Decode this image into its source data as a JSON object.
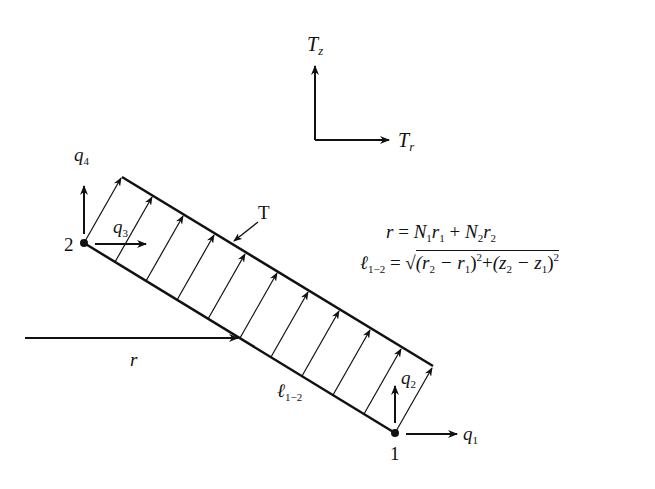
{
  "figure": {
    "type": "axisymmetric element surface traction diagram",
    "colors": {
      "ink": "#111111",
      "background": "#ffffff"
    }
  },
  "axes": {
    "vertical_label": {
      "main": "T",
      "sub": "z"
    },
    "horizontal_label": {
      "main": "T",
      "sub": "r"
    }
  },
  "nodes": {
    "node_1": {
      "label": "1",
      "dof_horizontal": {
        "main": "q",
        "sub": "1"
      },
      "dof_vertical": {
        "main": "q",
        "sub": "2"
      }
    },
    "node_2": {
      "label": "2",
      "dof_horizontal": {
        "main": "q",
        "sub": "3"
      },
      "dof_vertical": {
        "main": "q",
        "sub": "4"
      }
    }
  },
  "element": {
    "traction_label": "T",
    "length_label": {
      "main": "ℓ",
      "sub": "1−2"
    },
    "radius_label": "r",
    "traction_arrow_count": 11
  },
  "equations": {
    "radius": {
      "lhs": "r",
      "equals": "=",
      "rhs": [
        "N",
        "1",
        "r",
        "1",
        " + ",
        "N",
        "2",
        "r",
        "2"
      ]
    },
    "length": {
      "lhs_main": "ℓ",
      "lhs_sub": "1−2",
      "equals": "=",
      "radical": "√",
      "term1_open": "(r",
      "term1_sub_a": "2",
      "term1_minus": " − r",
      "term1_sub_b": "1",
      "term1_close": ")",
      "term1_pow": "2",
      "plus": "+",
      "term2_open": "(z",
      "term2_sub_a": "2",
      "term2_minus": " − z",
      "term2_sub_b": "1",
      "term2_close": ")",
      "term2_pow": "2"
    }
  }
}
